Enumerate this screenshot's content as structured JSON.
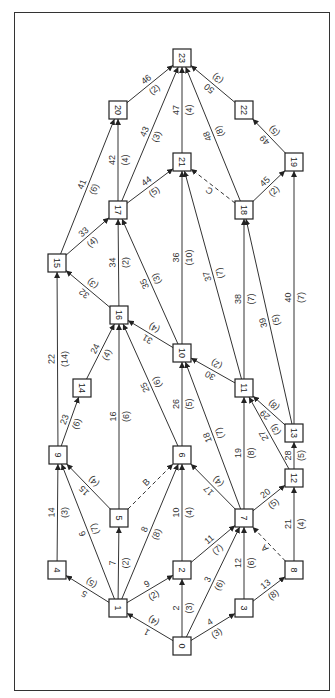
{
  "diagram": {
    "type": "activity-network",
    "orientation": "rotated-90",
    "nodes": [
      {
        "id": "0",
        "x": 182,
        "y": 646
      },
      {
        "id": "1",
        "x": 118,
        "y": 608
      },
      {
        "id": "2",
        "x": 182,
        "y": 570
      },
      {
        "id": "3",
        "x": 244,
        "y": 608
      },
      {
        "id": "4",
        "x": 57,
        "y": 570
      },
      {
        "id": "5",
        "x": 119,
        "y": 518
      },
      {
        "id": "6",
        "x": 182,
        "y": 455
      },
      {
        "id": "7",
        "x": 244,
        "y": 518
      },
      {
        "id": "8",
        "x": 294,
        "y": 570
      },
      {
        "id": "9",
        "x": 58,
        "y": 455
      },
      {
        "id": "10",
        "x": 182,
        "y": 353
      },
      {
        "id": "11",
        "x": 244,
        "y": 388
      },
      {
        "id": "12",
        "x": 294,
        "y": 478
      },
      {
        "id": "13",
        "x": 294,
        "y": 433
      },
      {
        "id": "14",
        "x": 82,
        "y": 388
      },
      {
        "id": "15",
        "x": 57,
        "y": 263
      },
      {
        "id": "16",
        "x": 119,
        "y": 315
      },
      {
        "id": "17",
        "x": 118,
        "y": 210
      },
      {
        "id": "18",
        "x": 244,
        "y": 210
      },
      {
        "id": "19",
        "x": 294,
        "y": 162
      },
      {
        "id": "20",
        "x": 118,
        "y": 110
      },
      {
        "id": "21",
        "x": 182,
        "y": 162
      },
      {
        "id": "22",
        "x": 244,
        "y": 110
      },
      {
        "id": "23",
        "x": 182,
        "y": 58
      }
    ],
    "edges": [
      {
        "from": "0",
        "to": "1",
        "activity": "1",
        "duration": "(4)"
      },
      {
        "from": "0",
        "to": "2",
        "activity": "2",
        "duration": "(3)"
      },
      {
        "from": "0",
        "to": "7",
        "activity": "3",
        "duration": "(6)"
      },
      {
        "from": "0",
        "to": "3",
        "activity": "4",
        "duration": "(3)"
      },
      {
        "from": "1",
        "to": "4",
        "activity": "5",
        "duration": "(5)"
      },
      {
        "from": "1",
        "to": "9",
        "activity": "6",
        "duration": "(7)"
      },
      {
        "from": "1",
        "to": "5",
        "activity": "7",
        "duration": "(2)"
      },
      {
        "from": "1",
        "to": "6",
        "activity": "8",
        "duration": "(8)"
      },
      {
        "from": "1",
        "to": "2",
        "activity": "9",
        "duration": "(2)"
      },
      {
        "from": "2",
        "to": "6",
        "activity": "10",
        "duration": "(4)"
      },
      {
        "from": "2",
        "to": "7",
        "activity": "11",
        "duration": "(7)"
      },
      {
        "from": "3",
        "to": "7",
        "activity": "12",
        "duration": "(6)"
      },
      {
        "from": "3",
        "to": "8",
        "activity": "13",
        "duration": "(8)"
      },
      {
        "from": "4",
        "to": "9",
        "activity": "14",
        "duration": "(3)"
      },
      {
        "from": "5",
        "to": "9",
        "activity": "15",
        "duration": "(4)"
      },
      {
        "from": "5",
        "to": "16",
        "activity": "16",
        "duration": "(6)"
      },
      {
        "from": "7",
        "to": "6",
        "activity": "17",
        "duration": "(4)"
      },
      {
        "from": "7",
        "to": "10",
        "activity": "18",
        "duration": "(7)"
      },
      {
        "from": "7",
        "to": "11",
        "activity": "19",
        "duration": "(8)"
      },
      {
        "from": "7",
        "to": "12",
        "activity": "20",
        "duration": "(5)"
      },
      {
        "from": "8",
        "to": "12",
        "activity": "21",
        "duration": "(4)"
      },
      {
        "from": "9",
        "to": "15",
        "activity": "22",
        "duration": "(14)"
      },
      {
        "from": "9",
        "to": "14",
        "activity": "23",
        "duration": "(6)"
      },
      {
        "from": "14",
        "to": "16",
        "activity": "24",
        "duration": "(4)"
      },
      {
        "from": "6",
        "to": "16",
        "activity": "25",
        "duration": "(6)"
      },
      {
        "from": "6",
        "to": "10",
        "activity": "26",
        "duration": "(5)"
      },
      {
        "from": "12",
        "to": "11",
        "activity": "27",
        "duration": "(3)"
      },
      {
        "from": "12",
        "to": "13",
        "activity": "28",
        "duration": "(5)"
      },
      {
        "from": "13",
        "to": "11",
        "activity": "29",
        "duration": "(8)"
      },
      {
        "from": "11",
        "to": "10",
        "activity": "30",
        "duration": "(2)"
      },
      {
        "from": "10",
        "to": "16",
        "activity": "31",
        "duration": "(4)"
      },
      {
        "from": "16",
        "to": "15",
        "activity": "32",
        "duration": "(3)"
      },
      {
        "from": "15",
        "to": "17",
        "activity": "33",
        "duration": "(4)"
      },
      {
        "from": "16",
        "to": "17",
        "activity": "34",
        "duration": "(2)"
      },
      {
        "from": "10",
        "to": "17",
        "activity": "35",
        "duration": "(3)"
      },
      {
        "from": "10",
        "to": "21",
        "activity": "36",
        "duration": "(10)"
      },
      {
        "from": "11",
        "to": "21",
        "activity": "37",
        "duration": "(7)"
      },
      {
        "from": "11",
        "to": "18",
        "activity": "38",
        "duration": "(7)"
      },
      {
        "from": "13",
        "to": "18",
        "activity": "39",
        "duration": "(5)"
      },
      {
        "from": "13",
        "to": "19",
        "activity": "40",
        "duration": "(7)"
      },
      {
        "from": "15",
        "to": "20",
        "activity": "41",
        "duration": "(6)"
      },
      {
        "from": "17",
        "to": "20",
        "activity": "42",
        "duration": "(4)"
      },
      {
        "from": "17",
        "to": "23",
        "activity": "43",
        "duration": "(3)"
      },
      {
        "from": "17",
        "to": "21",
        "activity": "44",
        "duration": "(5)"
      },
      {
        "from": "18",
        "to": "19",
        "activity": "45",
        "duration": "(2)"
      },
      {
        "from": "20",
        "to": "23",
        "activity": "46",
        "duration": "(2)"
      },
      {
        "from": "21",
        "to": "23",
        "activity": "47",
        "duration": "(4)"
      },
      {
        "from": "18",
        "to": "23",
        "activity": "48",
        "duration": "(8)"
      },
      {
        "from": "19",
        "to": "22",
        "activity": "49",
        "duration": "(5)"
      },
      {
        "from": "22",
        "to": "23",
        "activity": "50",
        "duration": "(3)"
      }
    ],
    "dummy_edges": [
      {
        "from": "5",
        "to": "6",
        "label": "B"
      },
      {
        "from": "8",
        "to": "7",
        "label": "A"
      },
      {
        "from": "18",
        "to": "21",
        "label": "C"
      }
    ]
  }
}
